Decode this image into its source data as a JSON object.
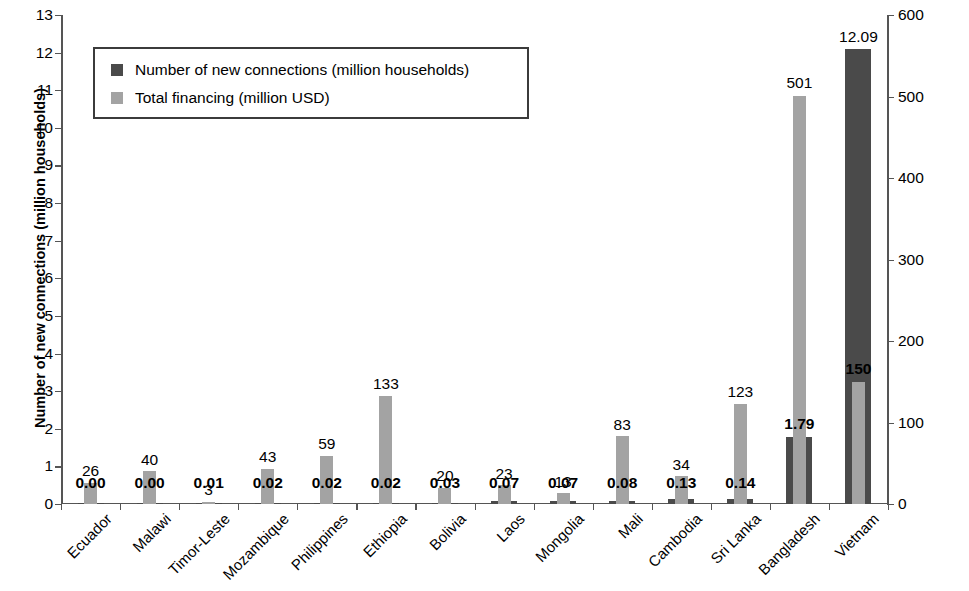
{
  "chart_data": {
    "type": "bar",
    "title": "",
    "subtitle": "",
    "xlabel": "",
    "ylabel": "Number of new connections (million households)",
    "y2label": "Financing (million USD)",
    "ylim": [
      0,
      13
    ],
    "y2lim": [
      0,
      600
    ],
    "yticks": [
      "0",
      "1",
      "2",
      "3",
      "4",
      "5",
      "6",
      "7",
      "8",
      "9",
      "10",
      "11",
      "12",
      "13"
    ],
    "y2ticks": [
      "0",
      "100",
      "200",
      "300",
      "400",
      "500",
      "600"
    ],
    "grid": false,
    "legend_position": "top-left",
    "categories": [
      "Ecuador",
      "Malawi",
      "Timor-Leste",
      "Mozambique",
      "Philippines",
      "Ethiopia",
      "Bolivia",
      "Laos",
      "Mongolia",
      "Mali",
      "Cambodia",
      "Sri Lanka",
      "Bangladesh",
      "Vietnam"
    ],
    "series": [
      {
        "name": "Number of new connections (million households)",
        "axis": "left",
        "color": "#4a4a4a",
        "values": [
          0.0,
          0.0,
          0.01,
          0.02,
          0.02,
          0.02,
          0.03,
          0.07,
          0.07,
          0.08,
          0.13,
          0.14,
          1.79,
          12.09
        ],
        "labels": [
          "0.00",
          "0.00",
          "0.01",
          "0.02",
          "0.02",
          "0.02",
          "0.03",
          "0.07",
          "0.07",
          "0.08",
          "0.13",
          "0.14",
          "1.79",
          "12.09"
        ]
      },
      {
        "name": "Total financing (million USD)",
        "axis": "right",
        "color": "#a3a3a3",
        "values": [
          26,
          40,
          3,
          43,
          59,
          133,
          20,
          23,
          13,
          83,
          34,
          123,
          501,
          150
        ],
        "labels": [
          "26",
          "40",
          "3",
          "43",
          "59",
          "133",
          "20",
          "23",
          "13",
          "83",
          "34",
          "123",
          "501",
          "150"
        ]
      }
    ]
  },
  "legend": {
    "items": [
      {
        "label": "Number of new connections (million households)",
        "swatch": "dark-square-icon"
      },
      {
        "label": "Total financing (million USD)",
        "swatch": "light-square-icon"
      }
    ]
  }
}
